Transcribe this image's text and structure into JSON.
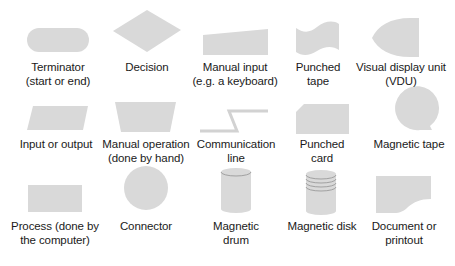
{
  "diagram": {
    "type": "flowchart-symbol-reference",
    "fill_color": "#d9d9d9",
    "line_color": "#a6a6a6",
    "text_color": "#1a1a1a",
    "symbols": [
      {
        "id": "terminator",
        "line1": "Terminator",
        "line2": "(start or end)"
      },
      {
        "id": "decision",
        "line1": "Decision",
        "line2": ""
      },
      {
        "id": "manual-input",
        "line1": "Manual input",
        "line2": "(e.g. a keyboard)"
      },
      {
        "id": "punched-tape",
        "line1": "Punched",
        "line2": "tape"
      },
      {
        "id": "vdu",
        "line1": "Visual display unit",
        "line2": "(VDU)"
      },
      {
        "id": "input-output",
        "line1": "Input or output",
        "line2": ""
      },
      {
        "id": "manual-operation",
        "line1": "Manual operation",
        "line2": "(done by hand)"
      },
      {
        "id": "communication-line",
        "line1": "Communication",
        "line2": "line"
      },
      {
        "id": "punched-card",
        "line1": "Punched",
        "line2": "card"
      },
      {
        "id": "magnetic-tape",
        "line1": "Magnetic tape",
        "line2": ""
      },
      {
        "id": "process",
        "line1": "Process (done by",
        "line2": "the computer)"
      },
      {
        "id": "connector",
        "line1": "Connector",
        "line2": ""
      },
      {
        "id": "magnetic-drum",
        "line1": "Magnetic",
        "line2": "drum"
      },
      {
        "id": "magnetic-disk",
        "line1": "Magnetic disk",
        "line2": ""
      },
      {
        "id": "document",
        "line1": "Document or",
        "line2": "printout"
      }
    ]
  }
}
